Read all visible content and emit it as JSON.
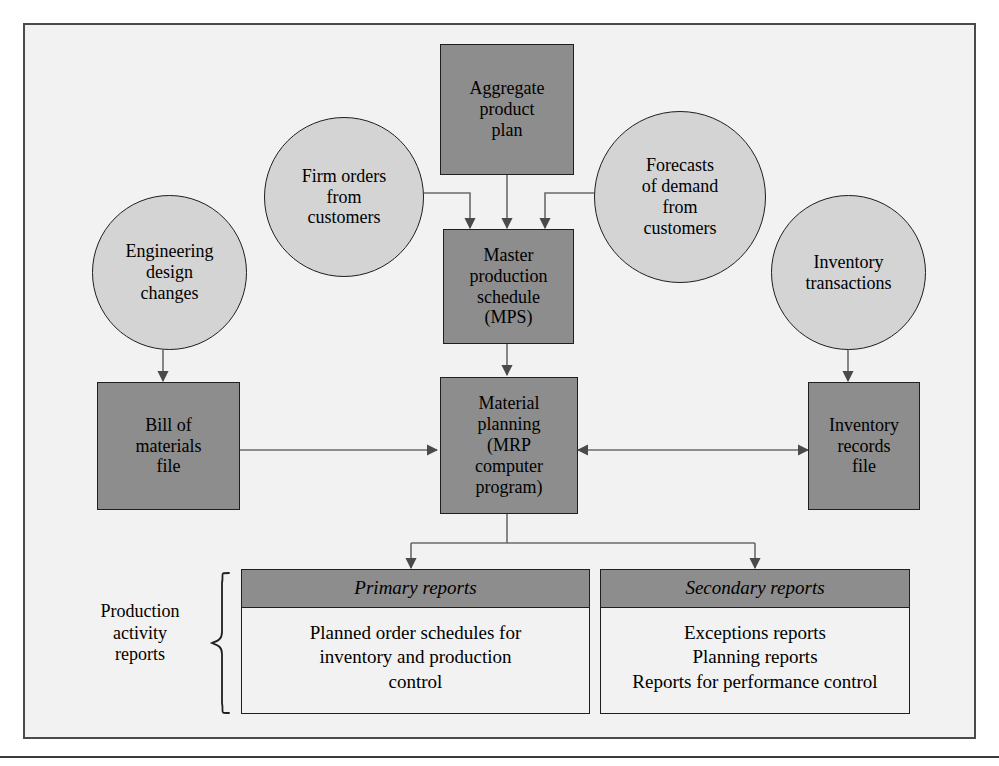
{
  "figure": {
    "kind": "mrp-system-flow-diagram",
    "colors": {
      "dark_fill": "#8d8d8d",
      "circle_fill": "#d4d4d4",
      "page_fill": "#f2f2f2",
      "stroke": "#1f1f1f",
      "frame_stroke": "#4a4a4a"
    }
  },
  "nodes": {
    "aggregate_product_plan": "Aggregate\nproduct\nplan",
    "firm_orders": "Firm orders\nfrom\ncustomers",
    "forecasts_of_demand": "Forecasts\nof demand\nfrom\ncustomers",
    "engineering_design_changes": "Engineering\ndesign\nchanges",
    "inventory_transactions": "Inventory\ntransactions",
    "master_production_schedule": "Master\nproduction\nschedule\n(MPS)",
    "bill_of_materials_file": "Bill of\nmaterials\nfile",
    "material_planning": "Material\nplanning\n(MRP\ncomputer\nprogram)",
    "inventory_records_file": "Inventory\nrecords\nfile"
  },
  "reports": {
    "production_activity_label": "Production\nactivity\nreports",
    "primary": {
      "header": "Primary reports",
      "body": "Planned order schedules for\ninventory and production\ncontrol"
    },
    "secondary": {
      "header": "Secondary reports",
      "body": "Exceptions reports\nPlanning reports\nReports for performance control"
    }
  },
  "connections": [
    {
      "from": "aggregate_product_plan",
      "to": "master_production_schedule",
      "style": "arrow"
    },
    {
      "from": "firm_orders",
      "to": "master_production_schedule",
      "style": "elbow-arrow"
    },
    {
      "from": "forecasts_of_demand",
      "to": "master_production_schedule",
      "style": "elbow-arrow"
    },
    {
      "from": "engineering_design_changes",
      "to": "bill_of_materials_file",
      "style": "arrow"
    },
    {
      "from": "inventory_transactions",
      "to": "inventory_records_file",
      "style": "arrow"
    },
    {
      "from": "master_production_schedule",
      "to": "material_planning",
      "style": "arrow"
    },
    {
      "from": "bill_of_materials_file",
      "to": "material_planning",
      "style": "arrow"
    },
    {
      "from": "material_planning",
      "to": "inventory_records_file",
      "style": "double-arrow"
    },
    {
      "from": "material_planning",
      "to": "primary_reports",
      "style": "branch-arrow"
    },
    {
      "from": "material_planning",
      "to": "secondary_reports",
      "style": "branch-arrow"
    }
  ]
}
